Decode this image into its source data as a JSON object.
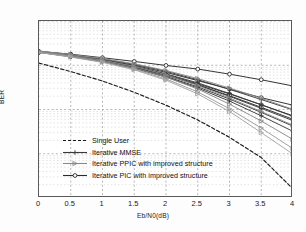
{
  "chart_data": {
    "type": "line",
    "title": "",
    "xlabel": "Eb/N0(dB)",
    "ylabel": "BER",
    "xlim": [
      0,
      4
    ],
    "ylim": [
      0.0001,
      1
    ],
    "yscale": "log",
    "grid": true,
    "legend_position": "lower-left",
    "xticks": [
      "0",
      "0.5",
      "1",
      "1.5",
      "2",
      "2.5",
      "3",
      "3.5",
      "4"
    ],
    "xtick_values": [
      0,
      0.5,
      1,
      1.5,
      2,
      2.5,
      3,
      3.5,
      4
    ],
    "ytick_labels": [
      "10^0",
      "10^-1",
      "10^-2",
      "10^-3",
      "10^-4"
    ],
    "ytick_values": [
      1,
      0.1,
      0.01,
      0.001,
      0.0001
    ],
    "x": [
      0,
      0.5,
      1,
      1.5,
      2,
      2.5,
      3,
      3.5,
      4
    ],
    "legend": [
      "Single User",
      "Iterative MMSE",
      "Iterative PPIC with improved structure",
      "Iterative PIC with improved structure"
    ],
    "series": [
      {
        "name": "Single User",
        "group": "single-user",
        "marker": "none",
        "style": "dashed",
        "color": "#1a1a1a",
        "values": [
          0.112,
          0.072,
          0.044,
          0.0245,
          0.0125,
          0.0058,
          0.00235,
          0.00082,
          0.00016
        ]
      },
      {
        "name": "Iterative PIC with improved structure, iteration 1",
        "group": "pic",
        "marker": "circle",
        "style": "solid",
        "color": "#2b2b2b",
        "values": [
          0.205,
          0.178,
          0.148,
          0.122,
          0.099,
          0.082,
          0.063,
          0.047,
          0.034
        ]
      },
      {
        "name": "Iterative PIC with improved structure, iteration 2",
        "group": "pic",
        "marker": "circle",
        "style": "solid",
        "color": "#2b2b2b",
        "values": [
          0.2,
          0.165,
          0.133,
          0.1,
          0.069,
          0.045,
          0.029,
          0.0185,
          0.0125
        ]
      },
      {
        "name": "Iterative PIC with improved structure, iteration 3",
        "group": "pic",
        "marker": "circle",
        "style": "solid",
        "color": "#2b2b2b",
        "values": [
          0.198,
          0.16,
          0.126,
          0.092,
          0.062,
          0.038,
          0.0225,
          0.0128,
          0.0072
        ]
      },
      {
        "name": "Iterative PIC with improved structure, iteration 4",
        "group": "pic",
        "marker": "circle",
        "style": "solid",
        "color": "#2b2b2b",
        "values": [
          0.197,
          0.158,
          0.124,
          0.09,
          0.06,
          0.036,
          0.0205,
          0.0112,
          0.006
        ]
      },
      {
        "name": "Iterative MMSE, iteration 1",
        "group": "mmse",
        "marker": "plus",
        "style": "solid",
        "color": "#3a3a3a",
        "values": [
          0.207,
          0.172,
          0.138,
          0.105,
          0.073,
          0.047,
          0.0285,
          0.0168,
          0.0098
        ]
      },
      {
        "name": "Iterative MMSE, iteration 2",
        "group": "mmse",
        "marker": "plus",
        "style": "solid",
        "color": "#3a3a3a",
        "values": [
          0.202,
          0.165,
          0.13,
          0.096,
          0.064,
          0.04,
          0.023,
          0.0128,
          0.007
        ]
      },
      {
        "name": "Iterative MMSE, iteration 3",
        "group": "mmse",
        "marker": "plus",
        "style": "solid",
        "color": "#3a3a3a",
        "values": [
          0.199,
          0.161,
          0.126,
          0.091,
          0.06,
          0.036,
          0.0198,
          0.0106,
          0.0056
        ]
      },
      {
        "name": "Iterative MMSE, iteration 4",
        "group": "mmse",
        "marker": "plus",
        "style": "solid",
        "color": "#3a3a3a",
        "values": [
          0.197,
          0.158,
          0.122,
          0.087,
          0.056,
          0.0325,
          0.0172,
          0.0086,
          0.0042
        ]
      },
      {
        "name": "Iterative MMSE, iteration 5",
        "group": "mmse",
        "marker": "plus",
        "style": "solid",
        "color": "#3a3a3a",
        "values": [
          0.196,
          0.156,
          0.12,
          0.085,
          0.054,
          0.0305,
          0.0155,
          0.0072,
          0.0032
        ]
      },
      {
        "name": "Iterative PPIC with improved structure, iteration 1",
        "group": "ppic",
        "marker": "triangle",
        "style": "solid",
        "color": "#8a8a8a",
        "values": [
          0.21,
          0.175,
          0.142,
          0.108,
          0.076,
          0.05,
          0.0305,
          0.018,
          0.01
        ]
      },
      {
        "name": "Iterative PPIC with improved structure, iteration 2",
        "group": "ppic",
        "marker": "triangle",
        "style": "solid",
        "color": "#8a8a8a",
        "values": [
          0.203,
          0.166,
          0.13,
          0.094,
          0.061,
          0.035,
          0.0182,
          0.009,
          0.0044
        ]
      },
      {
        "name": "Iterative PPIC with improved structure, iteration 3",
        "group": "ppic",
        "marker": "triangle",
        "style": "solid",
        "color": "#8a8a8a",
        "values": [
          0.199,
          0.16,
          0.124,
          0.087,
          0.054,
          0.029,
          0.0132,
          0.0055,
          0.0021
        ]
      },
      {
        "name": "Iterative PPIC with improved structure, iteration 4",
        "group": "ppic",
        "marker": "triangle",
        "style": "solid",
        "color": "#9a9a9a",
        "values": [
          0.196,
          0.156,
          0.119,
          0.082,
          0.049,
          0.025,
          0.0104,
          0.0038,
          0.0013
        ]
      },
      {
        "name": "Iterative PPIC with improved structure, iteration 5",
        "group": "ppic",
        "marker": "triangle",
        "style": "solid",
        "color": "#a5a5a5",
        "values": [
          0.194,
          0.153,
          0.116,
          0.079,
          0.046,
          0.0225,
          0.009,
          0.003,
          0.00098
        ]
      }
    ]
  },
  "legend_items": [
    {
      "label": "Single User",
      "marker": "none",
      "style": "dashed",
      "color": "#1a1a1a"
    },
    {
      "label": "Iterative MMSE",
      "marker": "plus",
      "style": "solid",
      "color": "#3a3a3a"
    },
    {
      "label": "Iterative PPIC with improved structure",
      "marker": "triangle",
      "style": "solid",
      "color": "#8a8a8a"
    },
    {
      "label": "Iterative PIC with improved structure",
      "marker": "circle",
      "style": "solid",
      "color": "#2b2b2b"
    }
  ]
}
